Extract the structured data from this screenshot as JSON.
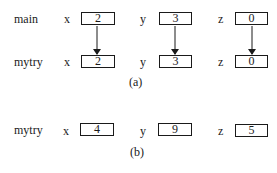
{
  "part_a": {
    "caption": "(a)",
    "rows": [
      {
        "scope": "main",
        "vars": [
          {
            "name": "x",
            "value": "2"
          },
          {
            "name": "y",
            "value": "3"
          },
          {
            "name": "z",
            "value": "0"
          }
        ]
      },
      {
        "scope": "mytry",
        "vars": [
          {
            "name": "x",
            "value": "2"
          },
          {
            "name": "y",
            "value": "3"
          },
          {
            "name": "z",
            "value": "0"
          }
        ]
      }
    ],
    "arrows": [
      {
        "from": "main.x",
        "to": "mytry.x"
      },
      {
        "from": "main.y",
        "to": "mytry.y"
      },
      {
        "from": "main.z",
        "to": "mytry.z"
      }
    ]
  },
  "part_b": {
    "caption": "(b)",
    "rows": [
      {
        "scope": "mytry",
        "vars": [
          {
            "name": "x",
            "value": "4"
          },
          {
            "name": "y",
            "value": "9"
          },
          {
            "name": "z",
            "value": "5"
          }
        ]
      }
    ]
  }
}
